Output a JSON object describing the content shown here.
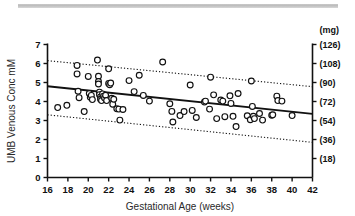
{
  "figure": {
    "top_rule_present": true,
    "background_color": "#ffffff",
    "ink_color": "#111111"
  },
  "chart_data": {
    "type": "scatter",
    "title": "",
    "subtitle": "",
    "xlabel": "Gestational Age (weeks)",
    "ylabel": "UMB Venous Conc mM",
    "y2label": "(mg)",
    "xlim": [
      16,
      42
    ],
    "ylim": [
      0,
      7
    ],
    "grid": false,
    "legend": "none",
    "xticks": [
      16,
      18,
      20,
      22,
      24,
      26,
      28,
      30,
      32,
      34,
      36,
      38,
      40,
      42
    ],
    "xticklabels": [
      "16",
      "18",
      "20",
      "22",
      "24",
      "26",
      "28",
      "30",
      "32",
      "34",
      "36",
      "38",
      "40",
      "42"
    ],
    "yticks": [
      0,
      1,
      2,
      3,
      4,
      5,
      6,
      7
    ],
    "yticklabels": [
      "0",
      "1",
      "2",
      "3",
      "4",
      "5",
      "6",
      "7"
    ],
    "y2ticks": [
      1,
      2,
      3,
      4,
      5,
      6,
      7
    ],
    "y2ticklabels": [
      "(18)",
      "(36)",
      "(54)",
      "(72)",
      "(90)",
      "(108)",
      "(126)"
    ],
    "marker": "open-circle",
    "marker_size": 4,
    "points": [
      [
        17.0,
        3.68
      ],
      [
        17.9,
        3.8
      ],
      [
        18.9,
        5.45
      ],
      [
        18.9,
        5.9
      ],
      [
        19.0,
        4.54
      ],
      [
        19.1,
        4.2
      ],
      [
        19.6,
        3.47
      ],
      [
        20.0,
        5.32
      ],
      [
        20.1,
        4.42
      ],
      [
        20.2,
        4.22
      ],
      [
        20.3,
        4.32
      ],
      [
        20.4,
        4.1
      ],
      [
        20.9,
        6.18
      ],
      [
        21.0,
        5.33
      ],
      [
        21.0,
        5.05
      ],
      [
        21.0,
        4.92
      ],
      [
        21.1,
        4.49
      ],
      [
        21.1,
        4.36
      ],
      [
        21.2,
        4.24
      ],
      [
        21.2,
        4.12
      ],
      [
        21.3,
        4.05
      ],
      [
        21.4,
        4.4
      ],
      [
        21.5,
        4.28
      ],
      [
        21.6,
        4.18
      ],
      [
        21.7,
        4.33
      ],
      [
        21.8,
        4.05
      ],
      [
        22.0,
        5.72
      ],
      [
        22.0,
        4.95
      ],
      [
        22.1,
        4.88
      ],
      [
        22.2,
        4.97
      ],
      [
        22.3,
        4.17
      ],
      [
        22.4,
        3.86
      ],
      [
        22.5,
        4.12
      ],
      [
        22.8,
        3.62
      ],
      [
        23.0,
        3.6
      ],
      [
        23.1,
        3.02
      ],
      [
        23.4,
        3.58
      ],
      [
        24.0,
        5.1
      ],
      [
        24.5,
        4.52
      ],
      [
        25.0,
        5.38
      ],
      [
        25.4,
        4.32
      ],
      [
        26.0,
        4.02
      ],
      [
        27.3,
        6.08
      ],
      [
        28.0,
        3.88
      ],
      [
        28.2,
        3.48
      ],
      [
        28.3,
        2.92
      ],
      [
        29.0,
        3.26
      ],
      [
        29.4,
        3.47
      ],
      [
        30.0,
        4.87
      ],
      [
        30.2,
        3.53
      ],
      [
        30.6,
        3.16
      ],
      [
        31.4,
        3.97
      ],
      [
        31.5,
        4.02
      ],
      [
        31.9,
        3.6
      ],
      [
        32.0,
        5.28
      ],
      [
        32.3,
        4.35
      ],
      [
        32.6,
        3.1
      ],
      [
        33.0,
        4.08
      ],
      [
        33.2,
        4.02
      ],
      [
        33.4,
        3.2
      ],
      [
        33.9,
        4.3
      ],
      [
        34.0,
        3.9
      ],
      [
        34.2,
        3.22
      ],
      [
        34.5,
        2.68
      ],
      [
        34.7,
        4.42
      ],
      [
        35.6,
        3.25
      ],
      [
        35.9,
        3.04
      ],
      [
        36.0,
        5.08
      ],
      [
        36.1,
        3.74
      ],
      [
        36.2,
        3.22
      ],
      [
        36.3,
        3.1
      ],
      [
        36.8,
        3.37
      ],
      [
        37.1,
        3.02
      ],
      [
        38.0,
        3.28
      ],
      [
        38.1,
        3.3
      ],
      [
        38.5,
        4.28
      ],
      [
        38.6,
        4.05
      ],
      [
        39.0,
        4.02
      ],
      [
        40.0,
        3.26
      ]
    ],
    "regression_line": {
      "style": "solid",
      "x": [
        16,
        42
      ],
      "y": [
        4.8,
        3.35
      ]
    },
    "confidence_band_upper": {
      "style": "dotted",
      "x": [
        16,
        42
      ],
      "y": [
        6.15,
        4.78
      ]
    },
    "confidence_band_lower": {
      "style": "dotted",
      "x": [
        16,
        42
      ],
      "y": [
        3.3,
        1.85
      ]
    }
  }
}
